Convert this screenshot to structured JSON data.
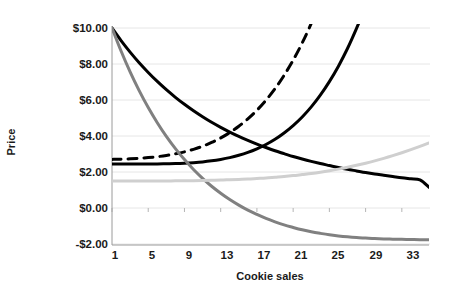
{
  "chart_data": {
    "type": "line",
    "title": "",
    "xlabel": "Cookie sales",
    "ylabel": "Price",
    "xlim": [
      1,
      36
    ],
    "ylim": [
      -2.0,
      10.0
    ],
    "grid": true,
    "legend": "none",
    "y_tick_labels": [
      "$10.00",
      "$8.00",
      "$6.00",
      "$4.00",
      "$2.00",
      "$0.00",
      "-$2.00"
    ],
    "y_tick_values": [
      10,
      8,
      6,
      4,
      2,
      0,
      -2
    ],
    "x_tick_labels": [
      "1",
      "5",
      "9",
      "13",
      "17",
      "21",
      "25",
      "29",
      "33"
    ],
    "x_tick_values": [
      1,
      5,
      9,
      13,
      17,
      21,
      25,
      29,
      33
    ],
    "x": [
      1,
      2,
      3,
      4,
      5,
      6,
      7,
      8,
      9,
      10,
      11,
      12,
      13,
      14,
      15,
      16,
      17,
      18,
      19,
      20,
      21,
      22,
      23,
      24,
      25,
      26,
      27,
      28,
      29,
      30,
      31,
      32,
      33,
      34,
      35,
      36
    ],
    "series": [
      {
        "name": "black-solid-decreasing",
        "style": "solid",
        "color": "#000000",
        "width": 3.0,
        "values": [
          10.0,
          9.3,
          8.66,
          8.07,
          7.53,
          7.03,
          6.57,
          6.15,
          5.76,
          5.4,
          5.07,
          4.76,
          4.48,
          4.22,
          3.98,
          3.76,
          3.55,
          3.36,
          3.18,
          3.02,
          2.86,
          2.72,
          2.59,
          2.47,
          2.36,
          2.25,
          2.15,
          2.06,
          1.97,
          1.89,
          1.82,
          1.75,
          1.68,
          1.62,
          1.56,
          1.15
        ]
      },
      {
        "name": "black-solid-increasing",
        "style": "solid",
        "color": "#000000",
        "width": 3.0,
        "values": [
          2.45,
          2.45,
          2.45,
          2.45,
          2.45,
          2.45,
          2.46,
          2.47,
          2.49,
          2.52,
          2.56,
          2.62,
          2.7,
          2.8,
          2.93,
          3.09,
          3.29,
          3.53,
          3.82,
          4.17,
          4.58,
          5.06,
          5.62,
          6.27,
          7.02,
          7.88,
          8.86,
          9.98,
          11.2,
          12.6,
          14.2,
          16.0,
          18.0,
          20.2,
          22.6,
          25.2
        ]
      },
      {
        "name": "black-dashed-increasing",
        "style": "dashed",
        "color": "#000000",
        "width": 3.0,
        "values": [
          2.7,
          2.71,
          2.73,
          2.76,
          2.8,
          2.85,
          2.92,
          3.01,
          3.12,
          3.26,
          3.43,
          3.64,
          3.89,
          4.19,
          4.54,
          4.95,
          5.43,
          5.99,
          6.63,
          7.37,
          8.21,
          9.17,
          10.26,
          11.5,
          12.9,
          14.48,
          16.26,
          18.26,
          20.5,
          23.0,
          25.8,
          28.9,
          32.3,
          36.1,
          40.3,
          45.0
        ]
      },
      {
        "name": "dark-grey-decreasing",
        "style": "solid",
        "color": "#808080",
        "width": 3.0,
        "values": [
          10.0,
          8.72,
          7.56,
          6.52,
          5.58,
          4.74,
          3.98,
          3.3,
          2.69,
          2.14,
          1.65,
          1.21,
          0.82,
          0.47,
          0.16,
          -0.12,
          -0.36,
          -0.58,
          -0.77,
          -0.94,
          -1.08,
          -1.21,
          -1.32,
          -1.41,
          -1.49,
          -1.55,
          -1.6,
          -1.64,
          -1.67,
          -1.7,
          -1.72,
          -1.73,
          -1.74,
          -1.75,
          -1.76,
          -1.76
        ]
      },
      {
        "name": "light-grey-increasing",
        "style": "solid",
        "color": "#cfcfcf",
        "width": 3.0,
        "values": [
          1.5,
          1.5,
          1.5,
          1.5,
          1.5,
          1.5,
          1.5,
          1.51,
          1.51,
          1.52,
          1.53,
          1.54,
          1.55,
          1.57,
          1.59,
          1.61,
          1.64,
          1.67,
          1.71,
          1.75,
          1.8,
          1.86,
          1.92,
          1.99,
          2.07,
          2.16,
          2.26,
          2.37,
          2.49,
          2.62,
          2.76,
          2.91,
          3.07,
          3.24,
          3.42,
          3.61
        ]
      }
    ]
  },
  "axes": {
    "axis_color": "#9a9a9a",
    "grid_color": "#e6e6e6",
    "text_color": "#1a1a1a"
  }
}
